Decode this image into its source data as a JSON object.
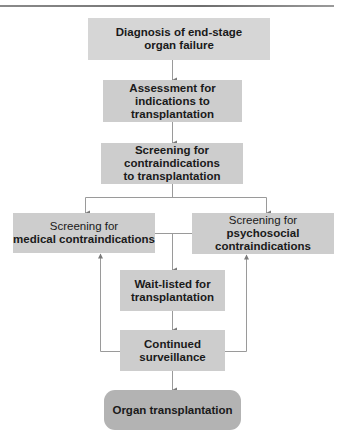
{
  "diagram": {
    "colors": {
      "box_fill_light": "#d6d6d6",
      "box_fill": "#cdcdcd",
      "final_box_fill": "#b3b3b3",
      "connector": "#9a9a9a",
      "arrowhead": "#7a7a7a",
      "top_rule": "#7a7a7a"
    },
    "nodes": {
      "diagnosis": {
        "line1": "Diagnosis of end-stage",
        "line2": "organ failure"
      },
      "assessment": {
        "line1": "Assessment for",
        "line2": "indications to",
        "line3": "transplantation"
      },
      "screening_contra": {
        "line1": "Screening for",
        "line2": "contraindications",
        "line3": "to transplantation"
      },
      "screening_medical": {
        "line1": "Screening for",
        "line2": "medical contraindications"
      },
      "screening_psychosocial": {
        "line1": "Screening for",
        "line2": "psychosocial",
        "line3": "contraindications"
      },
      "wait_listed": {
        "line1": "Wait-listed for",
        "line2": "transplantation"
      },
      "surveillance": {
        "line1": "Continued",
        "line2": "surveillance"
      },
      "transplantation": {
        "line1": "Organ transplantation"
      }
    },
    "edges": [
      {
        "from": "diagnosis",
        "to": "assessment"
      },
      {
        "from": "assessment",
        "to": "screening_contra"
      },
      {
        "from": "screening_contra",
        "to": "screening_medical"
      },
      {
        "from": "screening_contra",
        "to": "screening_psychosocial"
      },
      {
        "from": "screening_medical",
        "to": "wait_listed"
      },
      {
        "from": "screening_psychosocial",
        "to": "wait_listed"
      },
      {
        "from": "wait_listed",
        "to": "surveillance"
      },
      {
        "from": "surveillance",
        "to": "screening_medical"
      },
      {
        "from": "surveillance",
        "to": "screening_psychosocial"
      },
      {
        "from": "surveillance",
        "to": "transplantation"
      }
    ]
  }
}
